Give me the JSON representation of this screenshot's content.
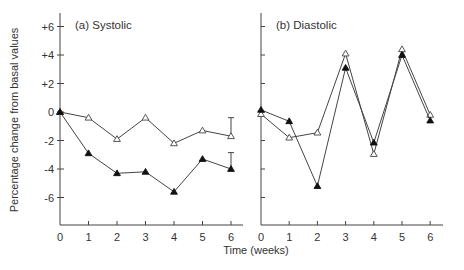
{
  "chart_data": [
    {
      "type": "line",
      "title": "(a) Systolic",
      "xlabel": "Time (weeks)",
      "ylabel": "Percentage change from basal values",
      "x": [
        0,
        1,
        2,
        3,
        4,
        5,
        6
      ],
      "xticks": [
        "0",
        "1",
        "2",
        "3",
        "4",
        "5",
        "6"
      ],
      "yticks": [
        "+6",
        "+4",
        "+2",
        "0",
        "-2",
        "-4",
        "-6"
      ],
      "ytick_values": [
        6,
        4,
        2,
        0,
        -2,
        -4,
        -6
      ],
      "ylim": [
        -8,
        7
      ],
      "xlim": [
        0,
        6.4
      ],
      "grid": false,
      "series": [
        {
          "name": "open triangles",
          "marker": "open-triangle",
          "values": [
            0,
            -0.4,
            -1.9,
            -0.4,
            -2.2,
            -1.3,
            -1.7
          ],
          "error_bar": {
            "x": 6,
            "top": -0.4
          }
        },
        {
          "name": "filled triangles",
          "marker": "filled-triangle",
          "values": [
            0,
            -2.9,
            -4.3,
            -4.2,
            -5.6,
            -3.3,
            -4.0
          ],
          "error_bar": {
            "x": 6,
            "top": -2.85
          }
        }
      ]
    },
    {
      "type": "line",
      "title": "(b) Diastolic",
      "xlabel": "Time (weeks)",
      "ylabel": "Percentage change from basal values",
      "x": [
        0,
        1,
        2,
        3,
        4,
        5,
        6
      ],
      "xticks": [
        "0",
        "1",
        "2",
        "3",
        "4",
        "5",
        "6"
      ],
      "ytick_values": [
        6,
        4,
        2,
        0,
        -2,
        -4,
        -6
      ],
      "ylim": [
        -8,
        7
      ],
      "xlim": [
        0,
        6.4
      ],
      "grid": false,
      "series": [
        {
          "name": "open triangles",
          "marker": "open-triangle",
          "values": [
            -0.15,
            -1.8,
            -1.45,
            4.1,
            -2.95,
            4.4,
            -0.2
          ]
        },
        {
          "name": "filled triangles",
          "marker": "filled-triangle",
          "values": [
            0.15,
            -0.65,
            -5.2,
            3.1,
            -2.15,
            4.0,
            -0.6
          ]
        }
      ]
    }
  ],
  "labels": {
    "panel_a_title": "(a) Systolic",
    "panel_b_title": "(b) Diastolic",
    "xlabel": "Time (weeks)",
    "ylabel": "Percentage change from basal values"
  }
}
